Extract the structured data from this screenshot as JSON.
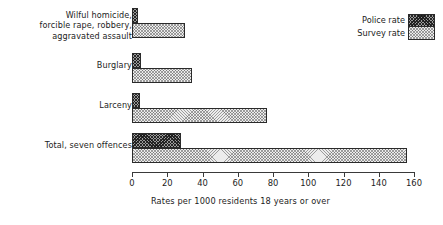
{
  "chart_data": {
    "type": "bar",
    "orientation": "horizontal",
    "title": "",
    "subtitle": "",
    "xlabel": "Rates per 1000 residents 18 years or over",
    "ylabel": "",
    "xlim": [
      0,
      160
    ],
    "xticks": [
      0,
      20,
      40,
      60,
      80,
      100,
      120,
      140,
      160
    ],
    "xtick_labels": [
      "0",
      "20",
      "40",
      "60",
      "80",
      "100",
      "120",
      "140",
      "160"
    ],
    "grid": false,
    "legend_position": "top-right",
    "categories": [
      "Wilful homicide,\nforcible rape, robbery,\naggravated assault",
      "Burglary",
      "Larceny",
      "Total, seven offences"
    ],
    "series": [
      {
        "name": "Police rate",
        "fill": "dark-crosshatch",
        "color": "#9b9b9b",
        "values": [
          3.4,
          5.2,
          4.8,
          28.0
        ]
      },
      {
        "name": "Survey rate",
        "fill": "light-crosshatch",
        "color": "#ececec",
        "values": [
          30.0,
          34.0,
          76.5,
          156.0
        ]
      }
    ]
  },
  "legend": {
    "entries": [
      {
        "label": "Police rate",
        "swatch": "police-rate-swatch"
      },
      {
        "label": "Survey rate",
        "swatch": "survey-rate-swatch"
      }
    ]
  },
  "axis": {
    "caption": "Rates per 1000 residents 18 years or over"
  }
}
